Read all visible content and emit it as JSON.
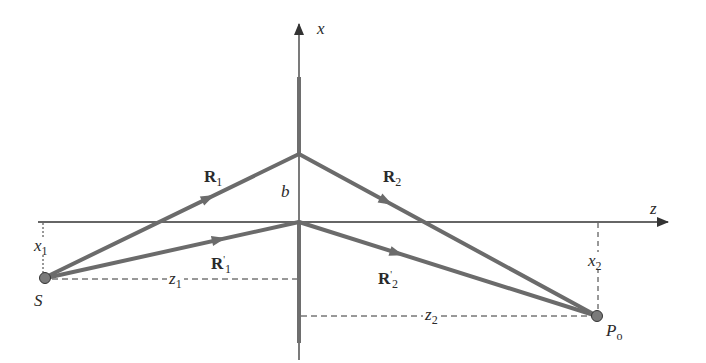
{
  "diagram": {
    "colors": {
      "ray": "#6b6b6b",
      "axis": "#333333",
      "barrier": "#6e6e6e",
      "point_fill": "#7a7a7a",
      "dash": "#333333",
      "text": "#2a2a2a"
    },
    "axes": {
      "vertical": {
        "label": "x"
      },
      "horizontal": {
        "label": "z"
      }
    },
    "points": {
      "source": {
        "label": "S"
      },
      "observer": {
        "label": "P",
        "subscript": "o"
      }
    },
    "rays": {
      "r1": {
        "label": "R",
        "subscript": "1"
      },
      "r2": {
        "label": "R",
        "subscript": "2"
      },
      "r1_prime": {
        "label": "R",
        "prime": "'",
        "subscript": "1"
      },
      "r2_prime": {
        "label": "R",
        "prime": "'",
        "subscript": "2"
      }
    },
    "dimensions": {
      "b": {
        "label": "b"
      },
      "x1": {
        "label": "x",
        "subscript": "1"
      },
      "x2": {
        "label": "x",
        "subscript": "2"
      },
      "z1": {
        "label": "z",
        "subscript": "1"
      },
      "z2": {
        "label": "z",
        "subscript": "2"
      }
    }
  }
}
